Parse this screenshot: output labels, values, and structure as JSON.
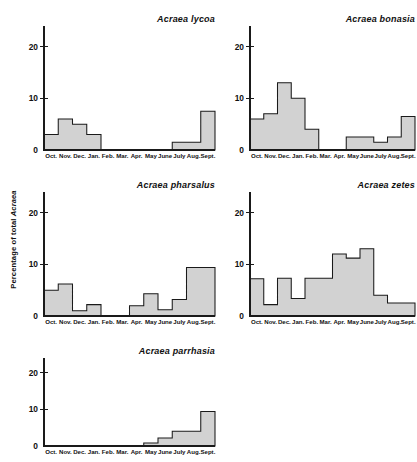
{
  "figure": {
    "ylabel_prefix": "Percentage of total ",
    "ylabel_italic": "Acraea",
    "months": [
      "Oct.",
      "Nov.",
      "Dec.",
      "Jan.",
      "Feb.",
      "Mar.",
      "Apr.",
      "May",
      "June",
      "July",
      "Aug.",
      "Sept."
    ],
    "ytick_labels": [
      "0",
      "10",
      "20"
    ],
    "fill_color": "#d2d2d2",
    "line_color": "#1a1a1a"
  },
  "chart_data": [
    {
      "type": "bar",
      "title": "Acraea lycoa",
      "categories": [
        "Oct.",
        "Nov.",
        "Dec.",
        "Jan.",
        "Feb.",
        "Mar.",
        "Apr.",
        "May",
        "June",
        "July",
        "Aug.",
        "Sept."
      ],
      "values": [
        3,
        6,
        5,
        3,
        0,
        0,
        0,
        0,
        0,
        1.5,
        1.5,
        7.5
      ],
      "xlabel": "",
      "ylabel": "Percentage of total Acraea",
      "ylim": [
        0,
        24
      ],
      "yticks": [
        0,
        10,
        20
      ],
      "grid": false,
      "legend": "none"
    },
    {
      "type": "bar",
      "title": "Acraea bonasia",
      "categories": [
        "Oct.",
        "Nov.",
        "Dec.",
        "Jan.",
        "Feb.",
        "Mar.",
        "Apr.",
        "May",
        "June",
        "July",
        "Aug.",
        "Sept."
      ],
      "values": [
        6,
        7,
        13,
        10,
        4,
        0,
        0,
        2.5,
        2.5,
        1.5,
        2.5,
        6.5
      ],
      "xlabel": "",
      "ylabel": "Percentage of total Acraea",
      "ylim": [
        0,
        24
      ],
      "yticks": [
        0,
        10,
        20
      ],
      "grid": false,
      "legend": "none"
    },
    {
      "type": "bar",
      "title": "Acraea pharsalus",
      "categories": [
        "Oct.",
        "Nov.",
        "Dec.",
        "Jan.",
        "Feb.",
        "Mar.",
        "Apr.",
        "May",
        "June",
        "July",
        "Aug.",
        "Sept."
      ],
      "values": [
        5,
        6.2,
        1,
        2.2,
        0,
        0,
        2,
        4.3,
        1.2,
        3.2,
        9.4,
        9.4
      ],
      "xlabel": "",
      "ylabel": "Percentage of total Acraea",
      "ylim": [
        0,
        24
      ],
      "yticks": [
        0,
        10,
        20
      ],
      "grid": false,
      "legend": "none"
    },
    {
      "type": "bar",
      "title": "Acraea zetes",
      "categories": [
        "Oct.",
        "Nov.",
        "Dec.",
        "Jan.",
        "Feb.",
        "Mar.",
        "Apr.",
        "May",
        "June",
        "July",
        "Aug.",
        "Sept."
      ],
      "values": [
        7.2,
        2.2,
        7.3,
        3.4,
        7.3,
        7.3,
        12,
        11.2,
        13,
        4,
        2.5,
        2.5
      ],
      "xlabel": "",
      "ylabel": "Percentage of total Acraea",
      "ylim": [
        0,
        24
      ],
      "yticks": [
        0,
        10,
        20
      ],
      "grid": false,
      "legend": "none"
    },
    {
      "type": "bar",
      "title": "Acraea parrhasia",
      "categories": [
        "Oct.",
        "Nov.",
        "Dec.",
        "Jan.",
        "Feb.",
        "Mar.",
        "Apr.",
        "May",
        "June",
        "July",
        "Aug.",
        "Sept."
      ],
      "values": [
        0,
        0,
        0,
        0,
        0,
        0,
        0,
        0.8,
        2.2,
        4,
        4,
        9.4
      ],
      "xlabel": "",
      "ylabel": "Percentage of total Acraea",
      "ylim": [
        0,
        24
      ],
      "yticks": [
        0,
        10,
        20
      ],
      "grid": false,
      "legend": "none"
    }
  ],
  "panels": [
    {
      "left": 22,
      "top": 8,
      "width": 195,
      "height": 158,
      "chart_index": 0
    },
    {
      "left": 228,
      "top": 8,
      "width": 189,
      "height": 158,
      "chart_index": 1
    },
    {
      "left": 22,
      "top": 174,
      "width": 195,
      "height": 158,
      "chart_index": 2
    },
    {
      "left": 228,
      "top": 174,
      "width": 189,
      "height": 158,
      "chart_index": 3
    },
    {
      "left": 22,
      "top": 340,
      "width": 195,
      "height": 122,
      "chart_index": 4
    }
  ]
}
